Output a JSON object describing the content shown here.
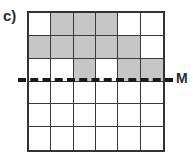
{
  "figure": {
    "part_label": "c)",
    "mirror_label": "M",
    "mirror_line_style": "dashed",
    "shade_color": "#c6c6c6",
    "line_color": "#333333",
    "background_color": "#ffffff"
  },
  "chart_data": {
    "type": "heatmap",
    "title": "c)",
    "xlabel": "",
    "ylabel": "",
    "rows": 6,
    "columns": 6,
    "categories": [
      "1",
      "2",
      "3",
      "4",
      "5",
      "6"
    ],
    "row_labels": [
      "1",
      "2",
      "3",
      "4",
      "5",
      "6"
    ],
    "legend": [
      {
        "label": "shaded",
        "value": 1,
        "color": "#c6c6c6"
      },
      {
        "label": "empty",
        "value": 0,
        "color": "#ffffff"
      }
    ],
    "values": [
      [
        0,
        1,
        1,
        1,
        0,
        0
      ],
      [
        1,
        1,
        1,
        1,
        1,
        0
      ],
      [
        0,
        0,
        1,
        0,
        1,
        1
      ],
      [
        0,
        0,
        0,
        0,
        0,
        0
      ],
      [
        0,
        0,
        0,
        0,
        0,
        0
      ],
      [
        0,
        0,
        0,
        0,
        0,
        0
      ]
    ],
    "annotations": [
      {
        "name": "mirror-line",
        "label": "M",
        "type": "horizontal-dashed-line",
        "position_after_row": 3
      }
    ],
    "grid": true,
    "legend_position": "none"
  }
}
